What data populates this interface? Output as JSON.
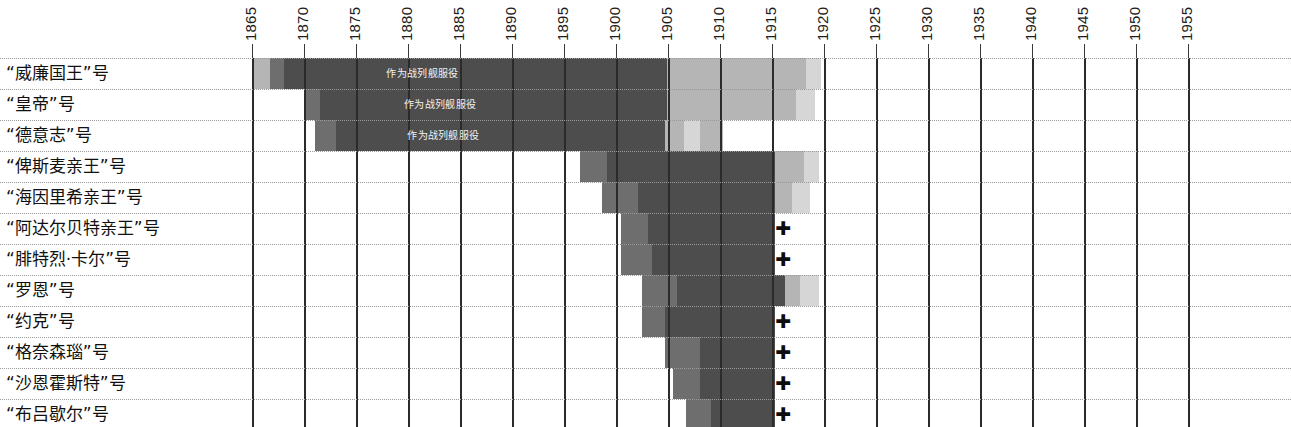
{
  "axis": {
    "label_orientation": "vertical",
    "year_start": 1865,
    "year_end": 1955,
    "tick_step": 5,
    "ticks": [
      "1865",
      "1870",
      "1875",
      "1880",
      "1885",
      "1890",
      "1895",
      "1900",
      "1905",
      "1910",
      "1915",
      "1920",
      "1925",
      "1930",
      "1935",
      "1940",
      "1945",
      "1950",
      "1955"
    ]
  },
  "legend_text": {
    "battleship_service": "作为战列舰服役"
  },
  "colors": {
    "dark": "#4d4d4d",
    "mid": "#6e6e6e",
    "light": "#b5b5b5",
    "pale": "#d6d6d6",
    "gridline": "#2b2b2b",
    "rowsep": "#9a9a9a",
    "text": "#111111"
  },
  "rows": [
    {
      "name": "“威廉国王”号",
      "bars": [
        {
          "start": 1865.0,
          "end": 1866.6,
          "shade": "light"
        },
        {
          "start": 1866.6,
          "end": 1868.0,
          "shade": "mid"
        },
        {
          "start": 1868.0,
          "end": 1894.6,
          "shade": "dark",
          "label": "作为战列舰服役"
        },
        {
          "start": 1894.6,
          "end": 1904.8,
          "shade": "dark"
        },
        {
          "start": 1904.8,
          "end": 1918.2,
          "shade": "light"
        },
        {
          "start": 1918.2,
          "end": 1919.6,
          "shade": "pale"
        }
      ],
      "cross": null
    },
    {
      "name": "“皇帝”号",
      "bars": [
        {
          "start": 1870.0,
          "end": 1871.4,
          "shade": "mid"
        },
        {
          "start": 1871.4,
          "end": 1894.6,
          "shade": "dark",
          "label": "作为战列舰服役"
        },
        {
          "start": 1894.6,
          "end": 1904.8,
          "shade": "dark"
        },
        {
          "start": 1904.8,
          "end": 1917.2,
          "shade": "light"
        },
        {
          "start": 1917.2,
          "end": 1919.0,
          "shade": "pale"
        }
      ],
      "cross": null
    },
    {
      "name": "“德意志”号",
      "bars": [
        {
          "start": 1871.0,
          "end": 1873.0,
          "shade": "mid"
        },
        {
          "start": 1873.0,
          "end": 1893.6,
          "shade": "dark",
          "label": "作为战列舰服役"
        },
        {
          "start": 1893.6,
          "end": 1904.6,
          "shade": "dark"
        },
        {
          "start": 1904.6,
          "end": 1906.4,
          "shade": "light"
        },
        {
          "start": 1906.4,
          "end": 1908.0,
          "shade": "pale"
        },
        {
          "start": 1908.0,
          "end": 1910.2,
          "shade": "light"
        }
      ],
      "cross": null
    },
    {
      "name": "“俾斯麦亲王”号",
      "bars": [
        {
          "start": 1896.4,
          "end": 1899.0,
          "shade": "mid"
        },
        {
          "start": 1899.0,
          "end": 1915.2,
          "shade": "dark"
        },
        {
          "start": 1915.2,
          "end": 1918.0,
          "shade": "light"
        },
        {
          "start": 1918.0,
          "end": 1919.4,
          "shade": "pale"
        }
      ],
      "cross": null
    },
    {
      "name": "“海因里希亲王”号",
      "bars": [
        {
          "start": 1898.6,
          "end": 1902.0,
          "shade": "mid"
        },
        {
          "start": 1902.0,
          "end": 1915.2,
          "shade": "dark"
        },
        {
          "start": 1915.2,
          "end": 1916.8,
          "shade": "light"
        },
        {
          "start": 1916.8,
          "end": 1918.6,
          "shade": "pale"
        }
      ],
      "cross": null
    },
    {
      "name": "“阿达尔贝特亲王”号",
      "bars": [
        {
          "start": 1900.4,
          "end": 1903.0,
          "shade": "mid"
        },
        {
          "start": 1903.0,
          "end": 1915.2,
          "shade": "dark"
        }
      ],
      "cross": 1915.9
    },
    {
      "name": "“腓特烈·卡尔”号",
      "bars": [
        {
          "start": 1900.4,
          "end": 1903.4,
          "shade": "mid"
        },
        {
          "start": 1903.4,
          "end": 1915.2,
          "shade": "dark"
        }
      ],
      "cross": 1915.9
    },
    {
      "name": "“罗恩”号",
      "bars": [
        {
          "start": 1902.4,
          "end": 1905.8,
          "shade": "mid"
        },
        {
          "start": 1905.8,
          "end": 1916.2,
          "shade": "dark"
        },
        {
          "start": 1916.2,
          "end": 1917.6,
          "shade": "light"
        },
        {
          "start": 1917.6,
          "end": 1919.4,
          "shade": "pale"
        }
      ],
      "cross": null
    },
    {
      "name": "“约克”号",
      "bars": [
        {
          "start": 1902.4,
          "end": 1904.6,
          "shade": "mid"
        },
        {
          "start": 1904.6,
          "end": 1915.2,
          "shade": "dark"
        }
      ],
      "cross": 1915.9
    },
    {
      "name": "“格奈森瑙”号",
      "bars": [
        {
          "start": 1904.6,
          "end": 1908.0,
          "shade": "mid"
        },
        {
          "start": 1908.0,
          "end": 1915.2,
          "shade": "dark"
        }
      ],
      "cross": 1915.9
    },
    {
      "name": "“沙恩霍斯特”号",
      "bars": [
        {
          "start": 1905.4,
          "end": 1908.0,
          "shade": "mid"
        },
        {
          "start": 1908.0,
          "end": 1915.2,
          "shade": "dark"
        }
      ],
      "cross": 1915.9
    },
    {
      "name": "“布吕歇尔”号",
      "bars": [
        {
          "start": 1906.6,
          "end": 1909.0,
          "shade": "mid"
        },
        {
          "start": 1909.0,
          "end": 1915.2,
          "shade": "dark"
        }
      ],
      "cross": 1915.9
    }
  ],
  "chart_data": {
    "type": "bar",
    "title": "",
    "xlabel": "",
    "ylabel": "",
    "xlim": [
      1863,
      1957
    ],
    "orientation": "horizontal-timeline",
    "grid": true,
    "legend_position": "none",
    "categories": [
      "“威廉国王”号",
      "“皇帝”号",
      "“德意志”号",
      "“俾斯麦亲王”号",
      "“海因里希亲王”号",
      "“阿达尔贝特亲王”号",
      "“腓特烈·卡尔”号",
      "“罗恩”号",
      "“约克”号",
      "“格奈森瑙”号",
      "“沙恩霍斯特”号",
      "“布吕歇尔”号"
    ],
    "tick_labels": [
      "1865",
      "1870",
      "1875",
      "1880",
      "1885",
      "1890",
      "1895",
      "1900",
      "1905",
      "1910",
      "1915",
      "1920",
      "1925",
      "1930",
      "1935",
      "1940",
      "1945",
      "1950",
      "1955"
    ],
    "annotations": [
      {
        "text": "作为战列舰服役",
        "row": "“威廉国王”号",
        "x": 1881
      },
      {
        "text": "作为战列舰服役",
        "row": "“皇帝”号",
        "x": 1881
      },
      {
        "text": "作为战列舰服役",
        "row": "“德意志”号",
        "x": 1881
      },
      {
        "text": "+",
        "row": "“阿达尔贝特亲王”号",
        "x": 1916
      },
      {
        "text": "+",
        "row": "“腓特烈·卡尔”号",
        "x": 1916
      },
      {
        "text": "+",
        "row": "“约克”号",
        "x": 1916
      },
      {
        "text": "+",
        "row": "“格奈森瑙”号",
        "x": 1916
      },
      {
        "text": "+",
        "row": "“沙恩霍斯特”号",
        "x": 1916
      },
      {
        "text": "+",
        "row": "“布吕歇尔”号",
        "x": 1916
      }
    ],
    "series": [
      {
        "name": "“威廉国王”号",
        "spans": [
          [
            1865.0,
            1868.0
          ],
          [
            1868.0,
            1904.8
          ],
          [
            1904.8,
            1919.6
          ]
        ]
      },
      {
        "name": "“皇帝”号",
        "spans": [
          [
            1870.0,
            1871.4
          ],
          [
            1871.4,
            1904.8
          ],
          [
            1904.8,
            1919.0
          ]
        ]
      },
      {
        "name": "“德意志”号",
        "spans": [
          [
            1871.0,
            1873.0
          ],
          [
            1873.0,
            1904.6
          ],
          [
            1904.6,
            1910.2
          ]
        ]
      },
      {
        "name": "“俾斯麦亲王”号",
        "spans": [
          [
            1896.4,
            1899.0
          ],
          [
            1899.0,
            1915.2
          ],
          [
            1915.2,
            1919.4
          ]
        ]
      },
      {
        "name": "“海因里希亲王”号",
        "spans": [
          [
            1898.6,
            1902.0
          ],
          [
            1902.0,
            1915.2
          ],
          [
            1915.2,
            1918.6
          ]
        ]
      },
      {
        "name": "“阿达尔贝特亲王”号",
        "spans": [
          [
            1900.4,
            1903.0
          ],
          [
            1903.0,
            1915.2
          ]
        ]
      },
      {
        "name": "“腓特烈·卡尔”号",
        "spans": [
          [
            1900.4,
            1903.4
          ],
          [
            1903.4,
            1915.2
          ]
        ]
      },
      {
        "name": "“罗恩”号",
        "spans": [
          [
            1902.4,
            1905.8
          ],
          [
            1905.8,
            1916.2
          ],
          [
            1916.2,
            1919.4
          ]
        ]
      },
      {
        "name": "“约克”号",
        "spans": [
          [
            1902.4,
            1904.6
          ],
          [
            1904.6,
            1915.2
          ]
        ]
      },
      {
        "name": "“格奈森瑙”号",
        "spans": [
          [
            1904.6,
            1908.0
          ],
          [
            1908.0,
            1915.2
          ]
        ]
      },
      {
        "name": "“沙恩霍斯特”号",
        "spans": [
          [
            1905.4,
            1908.0
          ],
          [
            1908.0,
            1915.2
          ]
        ]
      },
      {
        "name": "“布吕歇尔”号",
        "spans": [
          [
            1906.6,
            1909.0
          ],
          [
            1909.0,
            1915.2
          ]
        ]
      }
    ]
  }
}
